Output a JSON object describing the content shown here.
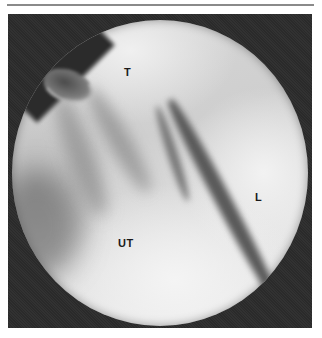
{
  "figure": {
    "type": "endoscopic photograph",
    "labels": {
      "top": "T",
      "right": "L",
      "center": "UT"
    },
    "colors": {
      "background": "#ffffff",
      "rule": "#8a8a8a",
      "photo_frame": "#2b2b2b",
      "label_text": "#1a1a1a"
    }
  }
}
